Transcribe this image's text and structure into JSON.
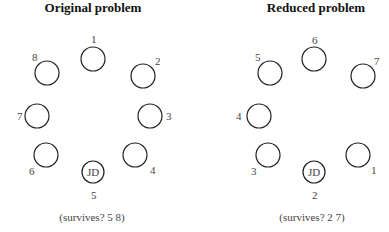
{
  "panels": [
    {
      "title": "Original problem",
      "caption": "(survives? 5 8)",
      "jd_label": "JD",
      "nodes": [
        {
          "label": "1",
          "cx": 93,
          "cy": 59,
          "lx": 91,
          "ly": 43
        },
        {
          "label": "2",
          "cx": 143,
          "cy": 76,
          "lx": 155,
          "ly": 65
        },
        {
          "label": "3",
          "cx": 150,
          "cy": 116,
          "lx": 166,
          "ly": 120
        },
        {
          "label": "4",
          "cx": 135,
          "cy": 155,
          "lx": 150,
          "ly": 174
        },
        {
          "label": "6",
          "cx": 46,
          "cy": 155,
          "lx": 29,
          "ly": 175
        },
        {
          "label": "7",
          "cx": 37,
          "cy": 116,
          "lx": 17,
          "ly": 120
        },
        {
          "label": "8",
          "cx": 47,
          "cy": 73,
          "lx": 32,
          "ly": 61
        }
      ],
      "jd": {
        "label": "5",
        "cx": 93,
        "cy": 172,
        "lx": 91,
        "ly": 199
      },
      "title_x": 93,
      "caption_x": 92
    },
    {
      "title": "Reduced problem",
      "caption": "(survives? 2 7)",
      "jd_label": "JD",
      "nodes": [
        {
          "label": "6",
          "cx": 314,
          "cy": 59,
          "lx": 312,
          "ly": 44
        },
        {
          "label": "7",
          "cx": 363,
          "cy": 76,
          "lx": 374,
          "ly": 65
        },
        {
          "label": "1",
          "cx": 358,
          "cy": 155,
          "lx": 371,
          "ly": 174
        },
        {
          "label": "3",
          "cx": 268,
          "cy": 155,
          "lx": 251,
          "ly": 175
        },
        {
          "label": "4",
          "cx": 259,
          "cy": 116,
          "lx": 236,
          "ly": 120
        },
        {
          "label": "5",
          "cx": 270,
          "cy": 73,
          "lx": 255,
          "ly": 61
        }
      ],
      "jd": {
        "label": "2",
        "cx": 314,
        "cy": 172,
        "lx": 312,
        "ly": 199
      },
      "title_x": 316,
      "caption_x": 312
    }
  ]
}
